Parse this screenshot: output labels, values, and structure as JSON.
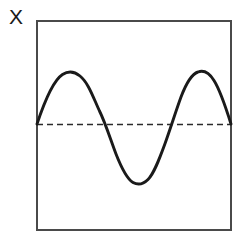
{
  "figure": {
    "background_color": "#ffffff",
    "axis_label": "X",
    "axis_label_color": "#1a1a1a",
    "frame": {
      "name": "plot-frame",
      "x": 37,
      "y": 21,
      "width": 194,
      "height": 209,
      "stroke_color": "#4a4a4a",
      "stroke_width": 1.4,
      "fill": "none"
    },
    "baseline": {
      "name": "zero-baseline",
      "y": 124.5,
      "x_start": 37,
      "x_end": 231,
      "stroke_color": "#2b2b2b",
      "stroke_width": 1.6,
      "dash_pattern": "6 4"
    },
    "curve": {
      "name": "sine-curve",
      "stroke_color": "#1a1a1a",
      "stroke_width": 2.9,
      "fill": "none"
    }
  },
  "chart_data": {
    "type": "line",
    "title": "",
    "subtitle": "",
    "xlabel": "",
    "ylabel": "X",
    "grid": false,
    "legend": null,
    "annotations": [
      {
        "name": "baseline",
        "kind": "horizontal-dashed-line",
        "y": 0
      }
    ],
    "xlim": [
      37,
      231
    ],
    "ylim": [
      -59,
      59
    ],
    "axis_ticks": {
      "x": [],
      "y": []
    },
    "series": [
      {
        "name": "sine",
        "waveform": "sinusoid",
        "amplitude_px_up": 52,
        "amplitude_px_down": 59,
        "period_px": 134,
        "phase_start": "zero-rising",
        "cycles_visible": 1.45,
        "key_points": [
          {
            "label": "left-edge-start",
            "x": 37,
            "y": 124
          },
          {
            "label": "peak-1",
            "x": 71,
            "y": 72
          },
          {
            "label": "zero-falling-1",
            "x": 105,
            "y": 124
          },
          {
            "label": "trough-1",
            "x": 139,
            "y": 183
          },
          {
            "label": "zero-rising-1",
            "x": 172,
            "y": 124
          },
          {
            "label": "peak-2",
            "x": 204,
            "y": 72
          },
          {
            "label": "right-edge-end",
            "x": 231,
            "y": 124
          }
        ],
        "path_d": "M 37,124 C 44,103 54,80 62.5,74.5 C 68,71 74.5,71.5 80,76 C 88.5,83 93,97 99.5,111 C 105,122 110,138 116,154 C 121.5,168 127,179 133,182.5 C 137.5,185 143,184.5 148,179.5 C 154,173.5 159,160 164.5,145 C 170,130 175.5,112 181,97 C 186.5,82.5 192,74 198,72 C 203.5,70 209,72.5 214,80.5 C 220,90 226,108 231,124"
      }
    ]
  }
}
